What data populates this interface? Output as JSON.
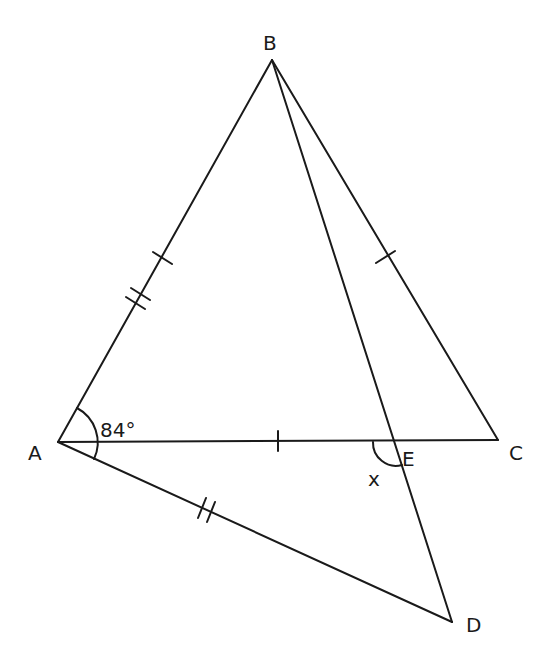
{
  "diagram": {
    "type": "geometry",
    "points": {
      "A": {
        "label": "A",
        "x": 58,
        "y": 442
      },
      "B": {
        "label": "B",
        "x": 272,
        "y": 60
      },
      "C": {
        "label": "C",
        "x": 498,
        "y": 440
      },
      "D": {
        "label": "D",
        "x": 452,
        "y": 622
      },
      "E": {
        "label": "E",
        "x": 396,
        "y": 441
      }
    },
    "segments": [
      "AB",
      "BC",
      "AC",
      "BD",
      "AD"
    ],
    "equal_marks": {
      "single_tick": [
        "AB",
        "BC",
        "AE"
      ],
      "double_tick": [
        "AB",
        "AD"
      ]
    },
    "angles": {
      "BAD": {
        "label": "84°"
      },
      "AED": {
        "label": "x"
      }
    }
  }
}
